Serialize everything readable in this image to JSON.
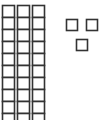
{
  "diagram": {
    "type": "base-ten-blocks",
    "tens_rods": 3,
    "units_per_rod": 10,
    "unit_cubes": 3,
    "represented_value": 33,
    "stroke_color": "#333333",
    "fill_color": "#ffffff"
  }
}
